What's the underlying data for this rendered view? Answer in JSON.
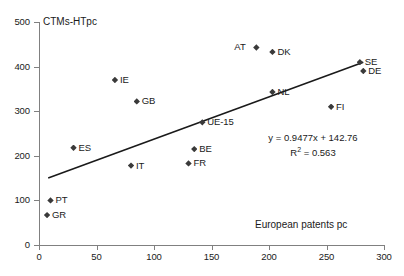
{
  "chart_data": {
    "type": "scatter",
    "title": "",
    "ylabel": "CTMs-HTpc",
    "xlabel": "European patents pc",
    "xlim": [
      0,
      300
    ],
    "ylim": [
      0,
      500
    ],
    "xticks": [
      0,
      50,
      100,
      150,
      200,
      250,
      300
    ],
    "yticks": [
      0,
      100,
      200,
      300,
      400,
      500
    ],
    "grid": false,
    "legend": "none",
    "marker_color": "#3a3a3a",
    "line_color": "#1a1a1a",
    "points": [
      {
        "label": "GR",
        "x": 7,
        "y": 67
      },
      {
        "label": "PT",
        "x": 10,
        "y": 100
      },
      {
        "label": "ES",
        "x": 30,
        "y": 218
      },
      {
        "label": "IE",
        "x": 66,
        "y": 370
      },
      {
        "label": "IT",
        "x": 80,
        "y": 178
      },
      {
        "label": "GB",
        "x": 85,
        "y": 322
      },
      {
        "label": "FR",
        "x": 130,
        "y": 183
      },
      {
        "label": "BE",
        "x": 135,
        "y": 215
      },
      {
        "label": "UE-15",
        "x": 142,
        "y": 275
      },
      {
        "label": "AT",
        "x": 189,
        "y": 443
      },
      {
        "label": "DK",
        "x": 203,
        "y": 433
      },
      {
        "label": "NL",
        "x": 203,
        "y": 343
      },
      {
        "label": "FI",
        "x": 254,
        "y": 310
      },
      {
        "label": "SE",
        "x": 279,
        "y": 410
      },
      {
        "label": "DE",
        "x": 282,
        "y": 390
      }
    ],
    "trendline": {
      "slope": 0.9477,
      "intercept": 142.76,
      "r_squared": 0.563,
      "equation_text": "y = 0.9477x + 142.76",
      "r2_prefix": "R",
      "r2_exp": "2",
      "r2_value": " = 0.563",
      "x_start": 8,
      "x_end": 282
    }
  }
}
